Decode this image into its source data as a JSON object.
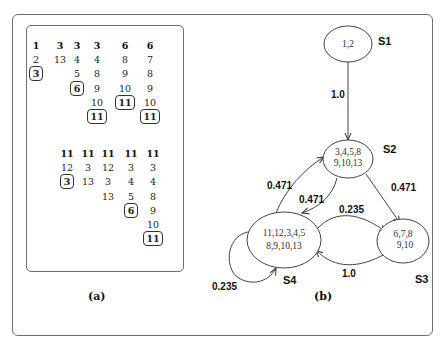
{
  "panel_a": {
    "caption": "(a)",
    "top_group": {
      "columns": [
        {
          "x": 36,
          "cells": [
            {
              "v": "1",
              "style": "bold"
            },
            {
              "v": "2",
              "style": "plain"
            },
            {
              "v": "3",
              "style": "boxed"
            }
          ]
        },
        {
          "x": 60,
          "cells": [
            {
              "v": "3",
              "style": "bold"
            },
            {
              "v": "13",
              "style": "plain"
            }
          ]
        },
        {
          "x": 77,
          "cells": [
            {
              "v": "3",
              "style": "bold"
            },
            {
              "v": "4",
              "style": "plain"
            },
            {
              "v": "5",
              "style": "plain"
            },
            {
              "v": "6",
              "style": "boxed"
            }
          ]
        },
        {
          "x": 97,
          "cells": [
            {
              "v": "3",
              "style": "bold"
            },
            {
              "v": "4",
              "style": "plain"
            },
            {
              "v": "8",
              "style": "plain"
            },
            {
              "v": "9",
              "style": "plain"
            },
            {
              "v": "10",
              "style": "plain"
            },
            {
              "v": "11",
              "style": "boxed"
            }
          ]
        },
        {
          "x": 125,
          "cells": [
            {
              "v": "6",
              "style": "bold"
            },
            {
              "v": "8",
              "style": "plain"
            },
            {
              "v": "9",
              "style": "plain"
            },
            {
              "v": "10",
              "style": "plain"
            },
            {
              "v": "11",
              "style": "boxed"
            }
          ]
        },
        {
          "x": 150,
          "cells": [
            {
              "v": "6",
              "style": "bold"
            },
            {
              "v": "7",
              "style": "plain"
            },
            {
              "v": "8",
              "style": "plain"
            },
            {
              "v": "9",
              "style": "plain"
            },
            {
              "v": "10",
              "style": "plain"
            },
            {
              "v": "11",
              "style": "boxed"
            }
          ]
        }
      ]
    },
    "bottom_group": {
      "columns": [
        {
          "x": 67,
          "cells": [
            {
              "v": "11",
              "style": "bold"
            },
            {
              "v": "12",
              "style": "plain"
            },
            {
              "v": "3",
              "style": "boxed"
            }
          ]
        },
        {
          "x": 88,
          "cells": [
            {
              "v": "11",
              "style": "bold"
            },
            {
              "v": "3",
              "style": "plain"
            },
            {
              "v": "13",
              "style": "plain"
            }
          ]
        },
        {
          "x": 108,
          "cells": [
            {
              "v": "11",
              "style": "bold"
            },
            {
              "v": "12",
              "style": "plain"
            },
            {
              "v": "3",
              "style": "plain"
            },
            {
              "v": "13",
              "style": "plain"
            }
          ]
        },
        {
          "x": 131,
          "cells": [
            {
              "v": "11",
              "style": "bold"
            },
            {
              "v": "3",
              "style": "plain"
            },
            {
              "v": "4",
              "style": "plain"
            },
            {
              "v": "5",
              "style": "plain"
            },
            {
              "v": "6",
              "style": "boxed"
            }
          ]
        },
        {
          "x": 153,
          "cells": [
            {
              "v": "11",
              "style": "bold"
            },
            {
              "v": "3",
              "style": "plain"
            },
            {
              "v": "4",
              "style": "plain"
            },
            {
              "v": "8",
              "style": "plain"
            },
            {
              "v": "9",
              "style": "plain"
            },
            {
              "v": "10",
              "style": "plain"
            },
            {
              "v": "11",
              "style": "boxed"
            }
          ]
        }
      ]
    }
  },
  "panel_b": {
    "caption": "(b)",
    "states": [
      {
        "id": "S1",
        "label": "S1",
        "lines": [
          "1,2"
        ]
      },
      {
        "id": "S2",
        "label": "S2",
        "lines": [
          "3,4,5,8",
          "9,10,13"
        ]
      },
      {
        "id": "S3",
        "label": "S3",
        "lines": [
          "6,7,8",
          "9,10"
        ]
      },
      {
        "id": "S4",
        "label": "S4",
        "lines": [
          "11,12,3,4,5",
          "8,9,10,13"
        ]
      }
    ],
    "transitions": [
      {
        "from": "S1",
        "to": "S2",
        "prob": "1.0"
      },
      {
        "from": "S2",
        "to": "S4",
        "prob": "0.471"
      },
      {
        "from": "S4",
        "to": "S2",
        "prob": "0.471"
      },
      {
        "from": "S2",
        "to": "S3",
        "prob": "0.471"
      },
      {
        "from": "S4",
        "to": "S3",
        "prob": "0.235"
      },
      {
        "from": "S3",
        "to": "S4",
        "prob": "1.0"
      },
      {
        "from": "S4",
        "to": "S4",
        "prob": "0.235"
      }
    ]
  }
}
